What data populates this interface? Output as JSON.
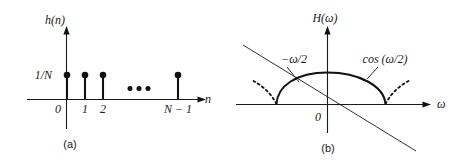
{
  "figure": {
    "panels": [
      {
        "id": "a",
        "caption": "(a)",
        "y_axis_label": "h(n)",
        "x_axis_label": "n",
        "amplitude_label": "1/N",
        "tick_labels": [
          "0",
          "1",
          "2",
          "N − 1"
        ],
        "ellipsis": "• • •",
        "description": "Impulse response h(n): N equal-amplitude samples of height 1/N at n = 0,1,2,...,N-1",
        "stem_height": 1,
        "stem_positions": [
          0,
          1,
          2,
          3
        ],
        "line_color": "#111111"
      },
      {
        "id": "b",
        "caption": "(b)",
        "y_axis_label": "H(ω)",
        "x_axis_label": "ω",
        "origin_label": "0",
        "annotations": [
          {
            "name": "phase-line-label",
            "text": "−ω/2"
          },
          {
            "name": "magnitude-curve-label",
            "text": "cos (ω/2)"
          }
        ],
        "description": "Frequency response H(ω): cosine main lobe with linear phase −ω/2",
        "line_color": "#111111"
      }
    ]
  }
}
